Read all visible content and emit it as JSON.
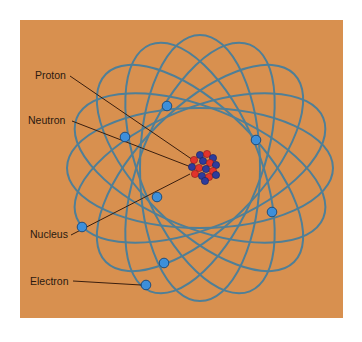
{
  "diagram": {
    "colors": {
      "background": "#D8904F",
      "orbit": "#4F7F97",
      "electron": "#3D8FDA",
      "proton": "#E2332B",
      "neutron": "#2E3C9C",
      "leader_line": "#3A1E0E",
      "label_text": "#2B1A10"
    },
    "panel": {
      "x": 20,
      "y": 20,
      "width": 323,
      "height": 298
    },
    "orbit_center": {
      "x": 200,
      "y": 168
    },
    "orbits": [
      {
        "rx": 133,
        "ry": 60,
        "angle": 0
      },
      {
        "rx": 133,
        "ry": 60,
        "angle": 22
      },
      {
        "rx": 133,
        "ry": 60,
        "angle": 45
      },
      {
        "rx": 133,
        "ry": 60,
        "angle": 68
      },
      {
        "rx": 133,
        "ry": 60,
        "angle": 90
      },
      {
        "rx": 133,
        "ry": 60,
        "angle": 112
      },
      {
        "rx": 133,
        "ry": 60,
        "angle": 135
      },
      {
        "rx": 133,
        "ry": 60,
        "angle": 158
      }
    ],
    "electrons": [
      {
        "x": 167,
        "y": 106
      },
      {
        "x": 125,
        "y": 137
      },
      {
        "x": 256,
        "y": 140
      },
      {
        "x": 157,
        "y": 197
      },
      {
        "x": 82,
        "y": 227
      },
      {
        "x": 272,
        "y": 212
      },
      {
        "x": 164,
        "y": 263
      },
      {
        "x": 146,
        "y": 285
      }
    ],
    "nucleus": {
      "center": {
        "x": 204,
        "y": 167
      },
      "particles": [
        {
          "type": "neutron",
          "x": 200,
          "y": 155
        },
        {
          "type": "proton",
          "x": 207,
          "y": 154
        },
        {
          "type": "neutron",
          "x": 213,
          "y": 158
        },
        {
          "type": "proton",
          "x": 194,
          "y": 160
        },
        {
          "type": "neutron",
          "x": 203,
          "y": 161
        },
        {
          "type": "proton",
          "x": 210,
          "y": 163
        },
        {
          "type": "neutron",
          "x": 216,
          "y": 165
        },
        {
          "type": "neutron",
          "x": 192,
          "y": 167
        },
        {
          "type": "proton",
          "x": 199,
          "y": 168
        },
        {
          "type": "neutron",
          "x": 206,
          "y": 169
        },
        {
          "type": "proton",
          "x": 213,
          "y": 171
        },
        {
          "type": "proton",
          "x": 195,
          "y": 174
        },
        {
          "type": "neutron",
          "x": 202,
          "y": 176
        },
        {
          "type": "proton",
          "x": 209,
          "y": 177
        },
        {
          "type": "neutron",
          "x": 216,
          "y": 175
        },
        {
          "type": "neutron",
          "x": 205,
          "y": 181
        }
      ],
      "particle_radius": 3.6
    },
    "labels": [
      {
        "id": "proton",
        "text": "Proton",
        "x": 35,
        "y": 79,
        "line": {
          "x1": 70,
          "y1": 76,
          "x2": 193,
          "y2": 160
        }
      },
      {
        "id": "neutron",
        "text": "Neutron",
        "x": 28,
        "y": 124,
        "line": {
          "x1": 72,
          "y1": 121,
          "x2": 191,
          "y2": 167
        }
      },
      {
        "id": "nucleus",
        "text": "Nucleus",
        "x": 30,
        "y": 238,
        "line": {
          "x1": 71,
          "y1": 235,
          "x2": 190,
          "y2": 174
        }
      },
      {
        "id": "electron",
        "text": "Electron",
        "x": 30,
        "y": 285,
        "line": {
          "x1": 73,
          "y1": 281,
          "x2": 141,
          "y2": 285
        }
      }
    ]
  }
}
